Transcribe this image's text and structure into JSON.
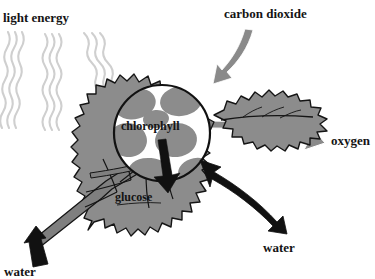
{
  "diagram": {
    "labels": {
      "light_energy": "light energy",
      "carbon_dioxide": "carbon dioxide",
      "oxygen": "oxygen",
      "chlorophyll": "chlorophyll",
      "glucose": "glucose",
      "water_out": "water",
      "water_in": "water"
    },
    "colors": {
      "leaf_fill": "#8c8c8c",
      "leaf_outline": "#1a1a1a",
      "vein": "#6f6f6f",
      "vein_outline": "#1a1a1a",
      "chloroplast": "#8c8c8c",
      "cell_gap": "#ffffff",
      "gray_arrow": "#8a8a8a",
      "black_arrow": "#111111",
      "light_ray": "#cfcfcf",
      "background": "#ffffff",
      "text": "#141414"
    },
    "elements": {
      "light_rays": {
        "name": "light-energy-rays",
        "count": 3,
        "style": "wavy",
        "direction": "from upper-left toward leaf"
      },
      "co2_arrow": {
        "name": "carbon-dioxide-arrow",
        "color": "gray",
        "direction": "down-left into leaf",
        "heads": 1
      },
      "oxygen_arrow": {
        "name": "oxygen-arrow",
        "color": "gray",
        "direction": "right out of leaf",
        "heads": 1
      },
      "glucose_arrow": {
        "name": "glucose-arrow",
        "color": "black",
        "direction": "down from chlorophyll circle",
        "heads": 1
      },
      "water_out_arrow": {
        "name": "water-transpiration-arrow",
        "color": "black",
        "direction": "double-headed, down-right from leaf",
        "heads": 2
      },
      "water_in_arrow": {
        "name": "water-uptake-arrow",
        "color": "black",
        "direction": "up along stem",
        "heads": 1
      },
      "magnifier": {
        "name": "chlorophyll-magnifier-circle",
        "shape": "circle",
        "content": "chloroplast cells"
      }
    }
  }
}
